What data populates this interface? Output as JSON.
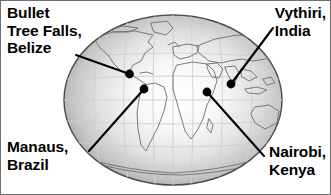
{
  "figure": {
    "background_color": "#ffffff",
    "border_color": "#6f6f6f",
    "width": 331,
    "height": 195
  },
  "globe": {
    "name": "world-globe",
    "shape": "ellipse",
    "center_x": 172,
    "center_y": 99,
    "radius_x": 110,
    "radius_y": 86,
    "rim_color": "#8e8e8e",
    "center_color": "#ffffff",
    "outline_color": "#4a4a4a",
    "graticule_color": "#c9c9c9",
    "coastline_color": "#7a7a7a"
  },
  "markers": [
    {
      "id": "belize",
      "label_lines": [
        "Bullet",
        "Tree Falls,",
        "Belize"
      ],
      "dot_x": 128.5,
      "dot_y": 73,
      "leader_x": 75,
      "leader_y": 54,
      "dot_color": "#000000",
      "leader_color": "#000000"
    },
    {
      "id": "vythiri",
      "label_lines": [
        "Vythiri,",
        "India"
      ],
      "dot_x": 230,
      "dot_y": 83,
      "leader_x": 272,
      "leader_y": 27,
      "dot_color": "#000000",
      "leader_color": "#000000"
    },
    {
      "id": "manaus",
      "label_lines": [
        "Manaus,",
        "Brazil"
      ],
      "dot_x": 143,
      "dot_y": 88,
      "leader_x": 88,
      "leader_y": 150,
      "dot_color": "#000000",
      "leader_color": "#000000"
    },
    {
      "id": "nairobi",
      "label_lines": [
        "Nairobi,",
        "Kenya"
      ],
      "dot_x": 206,
      "dot_y": 91,
      "leader_x": 263,
      "leader_y": 155,
      "dot_color": "#000000",
      "leader_color": "#000000"
    }
  ],
  "labels": {
    "belize": {
      "line1": "Bullet",
      "line2": "Tree Falls,",
      "line3": "Belize"
    },
    "vythiri": {
      "line1": "Vythiri,",
      "line2": "India"
    },
    "manaus": {
      "line1": "Manaus,",
      "line2": "Brazil"
    },
    "nairobi": {
      "line1": "Nairobi,",
      "line2": "Kenya"
    }
  }
}
